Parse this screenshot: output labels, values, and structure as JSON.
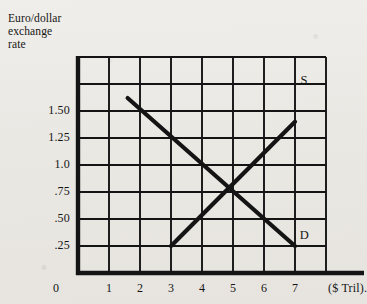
{
  "figure": {
    "y_axis_title": "Euro/dollar\nexchange\nrate",
    "x_axis_unit": "($ Tril).",
    "origin_label": "0"
  },
  "labels": {
    "supply": "S",
    "demand": "D"
  },
  "chart_data": {
    "type": "line",
    "title": "",
    "subtitle": "",
    "xlabel": "($ Tril).",
    "ylabel": "Euro/dollar exchange rate",
    "grid": true,
    "legend": "inline-curve-labels",
    "xlim": [
      0,
      8
    ],
    "ylim": [
      0,
      2.0
    ],
    "x_ticks": [
      1,
      2,
      3,
      4,
      5,
      6,
      7
    ],
    "x_tick_labels": [
      "1",
      "2",
      "3",
      "4",
      "5",
      "6",
      "7"
    ],
    "y_ticks": [
      0.25,
      0.5,
      0.75,
      1.0,
      1.25,
      1.5
    ],
    "y_tick_labels": [
      ".25",
      ".50",
      ".75",
      "1.0",
      "1.25",
      "1.50"
    ],
    "origin_tick_label": "0",
    "grid_columns": 8,
    "grid_rows": 8,
    "series": [
      {
        "name": "D",
        "role": "demand",
        "label": "D",
        "x": [
          1.6,
          7.0
        ],
        "y": [
          1.62,
          0.25
        ],
        "label_position": {
          "x": 7.35,
          "y": 0.33
        }
      },
      {
        "name": "S",
        "role": "supply",
        "label": "S",
        "x": [
          3.0,
          7.0
        ],
        "y": [
          0.25,
          1.4
        ],
        "label_position": {
          "x": 7.4,
          "y": 1.78
        }
      }
    ],
    "equilibrium": {
      "x": 5.0,
      "y": 0.75
    }
  },
  "style": {
    "ink": "#141414",
    "paper": "#eceae5"
  }
}
